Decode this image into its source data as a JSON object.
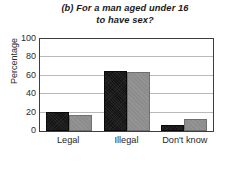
{
  "chart_data": {
    "type": "bar",
    "title": "(b) For a man aged under 16 to have sex?",
    "title_lines": [
      "(b) For a man aged under 16",
      "to have sex?"
    ],
    "xlabel": "",
    "ylabel": "Percentage",
    "categories": [
      "Legal",
      "Illegal",
      "Don't know"
    ],
    "series": [
      {
        "name": "Series 1",
        "color": "#131313",
        "values": [
          21,
          65,
          6
        ]
      },
      {
        "name": "Series 2",
        "color": "#8d8d8d",
        "values": [
          17,
          64,
          13
        ]
      }
    ],
    "ylim": [
      0,
      100
    ],
    "ytick_labels": [
      "100",
      "80",
      "60",
      "40",
      "20",
      "0"
    ],
    "ytick_values": [
      100,
      80,
      60,
      40,
      20,
      0
    ],
    "grid": true,
    "grid_axis": "y",
    "legend": false,
    "legend_position": "none"
  }
}
